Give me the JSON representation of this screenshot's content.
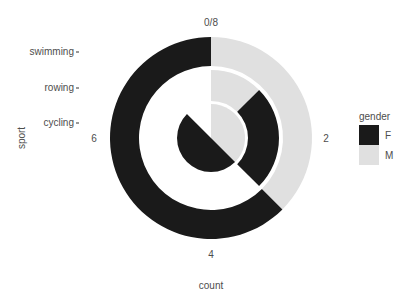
{
  "chart_data": {
    "type": "bar",
    "coord": "polar",
    "title": "",
    "xlabel": "sport",
    "ylabel": "count",
    "categories": [
      "cycling",
      "rowing",
      "swimming"
    ],
    "series": [
      {
        "name": "F",
        "values": [
          4,
          2,
          5
        ],
        "color": "#1a1a1a"
      },
      {
        "name": "M",
        "values": [
          3,
          1,
          3
        ],
        "color": "#e0e0e0"
      }
    ],
    "theta_ticks": [
      "0/8",
      "2",
      "4",
      "6"
    ],
    "ylim": [
      0,
      8
    ],
    "legend": {
      "title": "gender",
      "position": "right",
      "entries": [
        "F",
        "M"
      ]
    }
  },
  "axis": {
    "y_title": "sport",
    "x_title": "count",
    "tick_0": "0/8",
    "tick_2": "2",
    "tick_4": "4",
    "tick_6": "6",
    "cat_0": "cycling",
    "cat_1": "rowing",
    "cat_2": "swimming"
  },
  "legend": {
    "title": "gender",
    "f": "F",
    "m": "M"
  }
}
